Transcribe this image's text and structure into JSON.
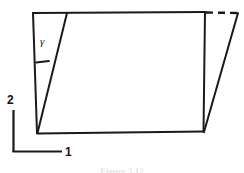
{
  "figure": {
    "title_caption": "Figure 3.12",
    "angle_label": "γ",
    "axes": {
      "horizontal_label": "1",
      "vertical_label": "2"
    },
    "colors": {
      "stroke": "#1a1a1a",
      "background": "#ffffff",
      "caption": "#cfcfcf"
    },
    "geometry": {
      "undeformed": {
        "top_left": [
          33,
          13
        ],
        "top_right": [
          205,
          12
        ],
        "bottom_right": [
          203,
          132
        ],
        "bottom_left": [
          37,
          133
        ]
      },
      "deformed_top_right": [
        238,
        13
      ],
      "shear_line_top": [
        67,
        13
      ],
      "shear_line_bottom": [
        37,
        133
      ],
      "dashed_segment": [
        [
          205,
          12
        ],
        [
          238,
          13
        ]
      ],
      "angle_tick": [
        [
          36,
          62
        ],
        [
          49,
          61
        ]
      ],
      "axis_corner": [
        13,
        152
      ],
      "axis_vertical_top": [
        13,
        110
      ],
      "axis_horizontal_right": [
        62,
        152
      ]
    },
    "line_styles": {
      "outline": "solid",
      "shear_edge": "solid",
      "original_top_edge": "dashed"
    }
  }
}
